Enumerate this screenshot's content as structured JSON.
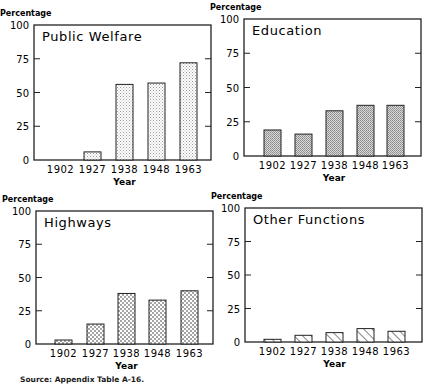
{
  "figure": {
    "source_note": "Source: Appendix Table A-16."
  },
  "chart_data": [
    {
      "type": "bar",
      "title": "Public Welfare",
      "xlabel": "Year",
      "ylabel": "Percentage",
      "categories": [
        "1902",
        "1927",
        "1938",
        "1948",
        "1963"
      ],
      "values": [
        0,
        6,
        56,
        57,
        72
      ],
      "ylim": [
        0,
        100
      ],
      "yticks": [
        "0",
        "25",
        "50",
        "75",
        "100"
      ],
      "fill_pattern": "fine-stipple",
      "grid": false
    },
    {
      "type": "bar",
      "title": "Education",
      "xlabel": "Year",
      "ylabel": "Percentage",
      "categories": [
        "1902",
        "1927",
        "1938",
        "1948",
        "1963"
      ],
      "values": [
        19,
        16,
        33,
        37,
        37
      ],
      "ylim": [
        0,
        100
      ],
      "yticks": [
        "0",
        "25",
        "50",
        "75",
        "100"
      ],
      "fill_pattern": "gray-stipple",
      "grid": false
    },
    {
      "type": "bar",
      "title": "Highways",
      "xlabel": "Year",
      "ylabel": "Percentage",
      "categories": [
        "1902",
        "1927",
        "1938",
        "1948",
        "1963"
      ],
      "values": [
        3,
        15,
        38,
        33,
        40
      ],
      "ylim": [
        0,
        100
      ],
      "yticks": [
        "0",
        "25",
        "50",
        "75",
        "100"
      ],
      "fill_pattern": "dots",
      "grid": false
    },
    {
      "type": "bar",
      "title": "Other Functions",
      "xlabel": "Year",
      "ylabel": "Percentage",
      "categories": [
        "1902",
        "1927",
        "1938",
        "1948",
        "1963"
      ],
      "values": [
        2,
        5,
        7,
        10,
        8
      ],
      "ylim": [
        0,
        100
      ],
      "yticks": [
        "0",
        "25",
        "50",
        "75",
        "100"
      ],
      "fill_pattern": "diagonal-hatch",
      "grid": false
    }
  ]
}
